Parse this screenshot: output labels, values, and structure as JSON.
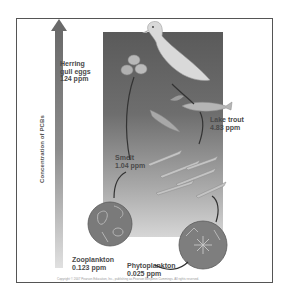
{
  "diagram": {
    "axis_label": "Concentration of PCBs",
    "colors": {
      "panel_top": "#5a5a5a",
      "panel_bottom": "#d6d6d6",
      "text": "#4a4a4a",
      "frame": "#555555"
    },
    "organisms": [
      {
        "name": "Herring gull eggs",
        "label": "Herring\ngull eggs\n124 ppm",
        "concentration_ppm": 124
      },
      {
        "name": "Lake trout",
        "label": "Lake trout\n4.83 ppm",
        "concentration_ppm": 4.83
      },
      {
        "name": "Smelt",
        "label": "Smelt\n1.04 ppm",
        "concentration_ppm": 1.04
      },
      {
        "name": "Zooplankton",
        "label": "Zooplankton\n0.123 ppm",
        "concentration_ppm": 0.123
      },
      {
        "name": "Phytoplankton",
        "label": "Phytoplankton\n0.025 ppm",
        "concentration_ppm": 0.025
      }
    ],
    "copyright": "Copyright © 2007 Pearson Education, Inc., publishing as Pearson Benjamin Cummings. All rights reserved."
  }
}
